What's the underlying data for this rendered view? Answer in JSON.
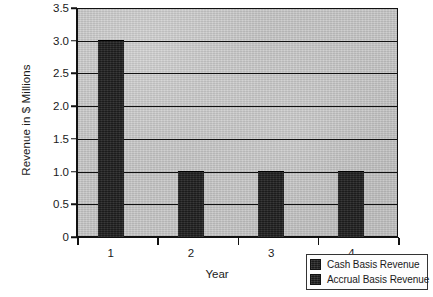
{
  "chart_data": {
    "type": "bar",
    "title": "",
    "xlabel": "Year",
    "ylabel": "Revenue in $ Millions",
    "categories": [
      "1",
      "2",
      "3",
      "4"
    ],
    "series": [
      {
        "name": "Cash Basis Revenue",
        "values": [
          3.0,
          1.0,
          1.0,
          1.0
        ],
        "color": "#262626"
      }
    ],
    "legend_entries": [
      {
        "label": "Cash Basis Revenue",
        "color": "#262626"
      },
      {
        "label": "Accrual Basis Revenue",
        "color": "#262626"
      }
    ],
    "ylim": [
      0,
      3.5
    ],
    "yticks": [
      "0",
      "0.5",
      "1.0",
      "1.5",
      "2.0",
      "2.5",
      "3.0",
      "3.5"
    ],
    "ytick_values": [
      0,
      0.5,
      1.0,
      1.5,
      2.0,
      2.5,
      3.0,
      3.5
    ],
    "xticks": [
      "1",
      "2",
      "3",
      "4"
    ],
    "grid": true,
    "grid_axis": "y",
    "legend_position": "bottom-right",
    "plot_background": "#c6c6c6",
    "figure_background": "#ffffff",
    "axis_color": "#111111"
  }
}
